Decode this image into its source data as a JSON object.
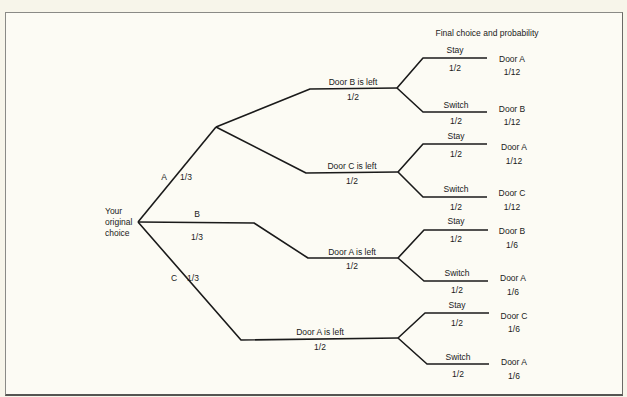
{
  "diagram": {
    "title": "Final choice and probability",
    "root_label": [
      "Your",
      "original",
      "choice"
    ],
    "first_level": [
      {
        "choice": "A",
        "prob": "1/3"
      },
      {
        "choice": "B",
        "prob": "1/3"
      },
      {
        "choice": "C",
        "prob": "1/3"
      }
    ],
    "second_level": [
      {
        "label": "Door B is left",
        "prob": "1/2"
      },
      {
        "label": "Door C is left",
        "prob": "1/2"
      },
      {
        "label": "Door A is left",
        "prob": "1/2"
      },
      {
        "label": "Door A is left",
        "prob": "1/2"
      }
    ],
    "third_level": [
      {
        "action": "Stay",
        "prob": "1/2",
        "final_door": "Door A",
        "final_prob": "1/12"
      },
      {
        "action": "Switch",
        "prob": "1/2",
        "final_door": "Door B",
        "final_prob": "1/12"
      },
      {
        "action": "Stay",
        "prob": "1/2",
        "final_door": "Door A",
        "final_prob": "1/12"
      },
      {
        "action": "Switch",
        "prob": "1/2",
        "final_door": "Door C",
        "final_prob": "1/12"
      },
      {
        "action": "Stay",
        "prob": "1/2",
        "final_door": "Door B",
        "final_prob": "1/6"
      },
      {
        "action": "Switch",
        "prob": "1/2",
        "final_door": "Door A",
        "final_prob": "1/6"
      },
      {
        "action": "Stay",
        "prob": "1/2",
        "final_door": "Door C",
        "final_prob": "1/6"
      },
      {
        "action": "Switch",
        "prob": "1/2",
        "final_door": "Door A",
        "final_prob": "1/6"
      }
    ],
    "colors": {
      "line": "#1a1a1a",
      "background": "#fcfbf4",
      "frame": "#6a6a66"
    }
  }
}
